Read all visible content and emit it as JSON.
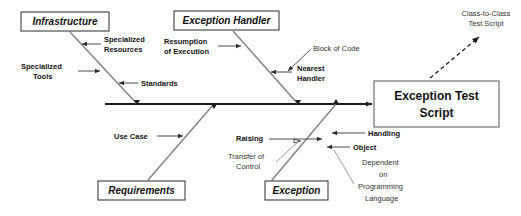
{
  "diagram": {
    "type": "fishbone-ishikawa",
    "effect": {
      "line1": "Exception Test",
      "line2": "Script"
    },
    "outcome": {
      "line1": "Class-to-Class",
      "line2": "Test Script"
    },
    "categories": [
      {
        "id": "infrastructure",
        "label": "Infrastructure",
        "position": "top-left"
      },
      {
        "id": "exception-handler",
        "label": "Exception Handler",
        "position": "top-middle"
      },
      {
        "id": "requirements",
        "label": "Requirements",
        "position": "bottom-left"
      },
      {
        "id": "exception",
        "label": "Exception",
        "position": "bottom-middle"
      }
    ],
    "causes": {
      "infrastructure": [
        {
          "id": "specialized-resources",
          "line1": "Specialized",
          "line2": "Resources"
        },
        {
          "id": "specialized-tools",
          "line1": "Specialized",
          "line2": "Tools"
        },
        {
          "id": "standards",
          "line1": "Standards",
          "line2": ""
        }
      ],
      "exception_handler": [
        {
          "id": "resumption-of-execution",
          "line1": "Resumption",
          "line2": "of Execution"
        },
        {
          "id": "block-of-code",
          "line1": "Block of Code",
          "line2": ""
        },
        {
          "id": "nearest-handler",
          "line1": "Nearest",
          "line2": "Handler"
        }
      ],
      "requirements": [
        {
          "id": "use-case",
          "line1": "Use Case",
          "line2": ""
        }
      ],
      "exception": [
        {
          "id": "raising",
          "line1": "Raising",
          "line2": ""
        },
        {
          "id": "transfer-of-control",
          "line1": "Transfer of",
          "line2": "Control"
        },
        {
          "id": "handling",
          "line1": "Handling",
          "line2": ""
        },
        {
          "id": "object",
          "line1": "Object",
          "line2": ""
        },
        {
          "id": "dependent-on-programming-language",
          "line1": "Dependent",
          "line2": "on",
          "line3": "Programming",
          "line4": "Language"
        }
      ]
    }
  },
  "colors": {
    "spine": "#1b1b1b",
    "rib": "#808080",
    "twig": "#4d4d4d",
    "box_stroke": "#2a2a2a",
    "text": "#111111",
    "background": "#ffffff"
  }
}
